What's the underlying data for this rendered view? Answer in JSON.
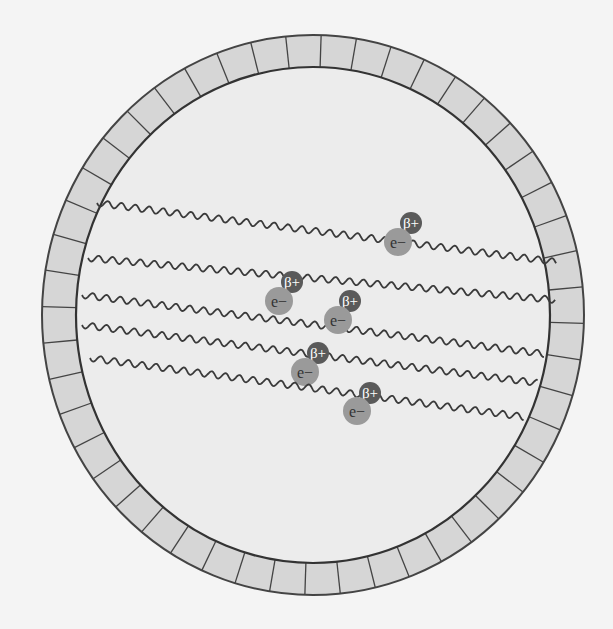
{
  "diagram": {
    "colors": {
      "background": "#f4f4f4",
      "ring_fill": "#d6d6d6",
      "interior_fill": "#ececec",
      "outline": "#444444",
      "photon": "#3a3a3a",
      "electron": "#9a9a9a",
      "positron": "#5a5a5a",
      "label": "#ffffff"
    },
    "ring": {
      "cx": 313,
      "cy": 315,
      "outer_rx": 271,
      "outer_ry": 280,
      "inner_rx": 237,
      "inner_ry": 248,
      "segments": 48
    },
    "electron_label": "e−",
    "positron_label": "β+",
    "events": [
      {
        "photon": {
          "x1": 97,
          "y1": 203,
          "x2": 557,
          "y2": 262
        },
        "electron": {
          "x": 398,
          "y": 242
        },
        "positron": {
          "x": 411,
          "y": 223
        }
      },
      {
        "photon": {
          "x1": 88,
          "y1": 258,
          "x2": 556,
          "y2": 300
        },
        "electron": {
          "x": 279,
          "y": 301
        },
        "positron": {
          "x": 292,
          "y": 282
        }
      },
      {
        "photon": {
          "x1": 82,
          "y1": 295,
          "x2": 545,
          "y2": 354
        },
        "electron": {
          "x": 338,
          "y": 320
        },
        "positron": {
          "x": 350,
          "y": 301
        }
      },
      {
        "photon": {
          "x1": 82,
          "y1": 325,
          "x2": 538,
          "y2": 383
        },
        "electron": {
          "x": 305,
          "y": 372
        },
        "positron": {
          "x": 318,
          "y": 353
        }
      },
      {
        "photon": {
          "x1": 90,
          "y1": 358,
          "x2": 525,
          "y2": 417
        },
        "electron": {
          "x": 357,
          "y": 411
        },
        "positron": {
          "x": 370,
          "y": 393
        }
      }
    ],
    "background_text": [
      {
        "text": "ose interaction with                    most clearly from tha",
        "x": 400,
        "y": 40
      },
      {
        "text": "frequency        y             the mathemat",
        "x": 400,
        "y": 70
      },
      {
        "text": "reaction               and         . After e",
        "x": 400,
        "y": 100
      }
    ]
  }
}
